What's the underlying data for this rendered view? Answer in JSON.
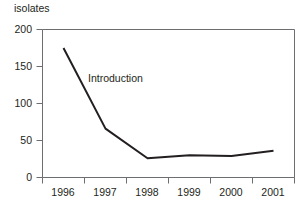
{
  "chart_data": {
    "type": "line",
    "title": "",
    "subtitle": "",
    "ylabel": "isolates",
    "xlabel": "",
    "categories": [
      "1996",
      "1997",
      "1998",
      "1999",
      "2000",
      "2001"
    ],
    "series": [
      {
        "name": "isolates",
        "values": [
          175,
          66,
          26,
          30,
          29,
          36
        ],
        "color": "#231f20"
      }
    ],
    "ylim": [
      0,
      200
    ],
    "yticks": [
      0,
      50,
      100,
      150,
      200
    ],
    "ytick_labels": [
      "0",
      "50",
      "100",
      "150",
      "200"
    ],
    "xtick_labels": [
      "1996",
      "1997",
      "1998",
      "1999",
      "2000",
      "2001"
    ],
    "grid": false,
    "legend": false,
    "legend_position": "none",
    "annotations": [
      {
        "text": "Introduction",
        "x_category": "1997",
        "y_value": 120
      }
    ],
    "axis_color": "#6d6e71",
    "frame": [
      "left",
      "bottom",
      "top",
      "right"
    ]
  },
  "labels": {
    "y_axis_title": "isolates",
    "annotation_introduction": "Introduction",
    "ytick_200": "200",
    "ytick_150": "150",
    "ytick_100": "100",
    "ytick_50": "50",
    "ytick_0": "0",
    "xtick_1996": "1996",
    "xtick_1997": "1997",
    "xtick_1998": "1998",
    "xtick_1999": "1999",
    "xtick_2000": "2000",
    "xtick_2001": "2001"
  }
}
